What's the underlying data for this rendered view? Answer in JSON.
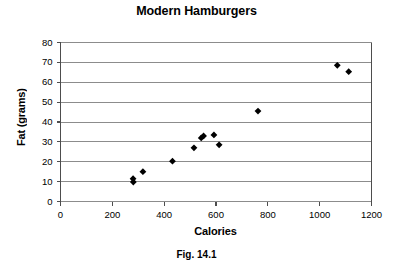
{
  "figure": {
    "title": "Modern Hamburgers",
    "caption": "Fig. 14.1"
  },
  "axes": {
    "xlabel": "Calories",
    "ylabel": "Fat (grams)",
    "xticks": [
      "0",
      "200",
      "400",
      "600",
      "800",
      "1000",
      "1200"
    ],
    "yticks": [
      "0",
      "10",
      "20",
      "30",
      "40",
      "50",
      "60",
      "70",
      "80"
    ]
  },
  "colors": {
    "marker": "#000000",
    "gridline": "#8c8c8c",
    "axis": "#6e6e6e",
    "background": "#ffffff"
  },
  "chart_data": {
    "type": "scatter",
    "title": "Modern Hamburgers",
    "xlabel": "Calories",
    "ylabel": "Fat (grams)",
    "xlim": [
      0,
      1200
    ],
    "ylim": [
      0,
      80
    ],
    "xtick_step": 200,
    "ytick_step": 10,
    "grid": "horizontal",
    "legend": "none",
    "marker": "diamond",
    "series": [
      {
        "name": "Hamburgers",
        "points": [
          {
            "x": 280,
            "y": 11.5
          },
          {
            "x": 281,
            "y": 9.8
          },
          {
            "x": 318,
            "y": 15.0
          },
          {
            "x": 432,
            "y": 20.3
          },
          {
            "x": 515,
            "y": 27.0
          },
          {
            "x": 543,
            "y": 32.0
          },
          {
            "x": 552,
            "y": 33.0
          },
          {
            "x": 592,
            "y": 33.5
          },
          {
            "x": 612,
            "y": 28.5
          },
          {
            "x": 762,
            "y": 45.5
          },
          {
            "x": 1068,
            "y": 68.5
          },
          {
            "x": 1112,
            "y": 65.3
          }
        ]
      }
    ]
  }
}
